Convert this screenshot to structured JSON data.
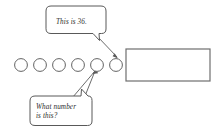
{
  "worksheet": {
    "title": "Counting circles with speech bubbles",
    "background_color": "#ffffff",
    "outline_color": "#595959",
    "text_color": "#2b2b2b"
  },
  "bubbles": [
    {
      "id": "statement-bubble",
      "name": "this-is-36-bubble",
      "text": "This is 36.",
      "lines": [
        "This is 36."
      ],
      "points_to": "circle-6",
      "tail_position": "bottom-right"
    },
    {
      "id": "question-bubble",
      "name": "what-number-is-this-bubble",
      "text": "What number is this?",
      "lines": [
        "What number",
        "is this?"
      ],
      "points_to": "circle-5",
      "tail_position": "top-right"
    }
  ],
  "circles": {
    "count": 6,
    "labels": [
      "",
      "",
      "",
      "",
      "",
      ""
    ],
    "fill": "#ffffff",
    "stroke": "#636363"
  },
  "answer_box": {
    "name": "answer-box",
    "value": "",
    "placeholder": ""
  }
}
